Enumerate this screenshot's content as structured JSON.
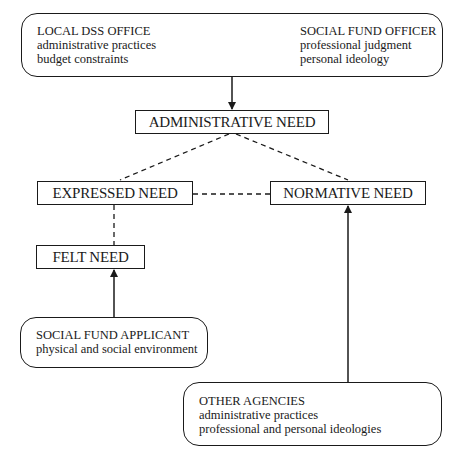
{
  "diagram": {
    "top_box": {
      "left": {
        "title": "LOCAL DSS OFFICE",
        "lines": [
          "administrative practices",
          "budget constraints"
        ]
      },
      "right": {
        "title": "SOCIAL FUND OFFICER",
        "lines": [
          "professional judgment",
          "personal ideology"
        ]
      }
    },
    "administrative_need": "ADMINISTRATIVE NEED",
    "expressed_need": "EXPRESSED NEED",
    "normative_need": "NORMATIVE NEED",
    "felt_need": "FELT NEED",
    "applicant_box": {
      "title": "SOCIAL FUND APPLICANT",
      "lines": [
        "physical and social environment"
      ]
    },
    "other_agencies_box": {
      "title": "OTHER AGENCIES",
      "lines": [
        "administrative practices",
        "professional and personal ideologies"
      ]
    },
    "colors": {
      "line": "#1a1a1a",
      "background": "#ffffff"
    }
  }
}
